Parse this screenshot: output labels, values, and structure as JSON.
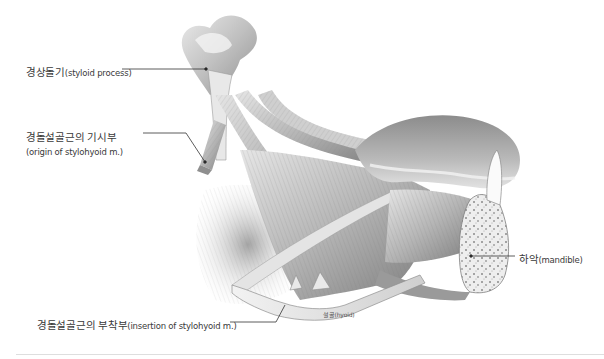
{
  "figure": {
    "labels": {
      "styloid_process": {
        "ko": "경상돌기",
        "en": "(styloid process)"
      },
      "origin": {
        "ko": "경돌설골근의 기시부",
        "en": "(origin of stylohyoid m.)"
      },
      "insertion": {
        "ko": "경돌설골근의 부착부",
        "en": "(insertion of stylohyoid m.)"
      },
      "mandible": {
        "ko": "하악",
        "en": "(mandible)"
      }
    },
    "inline_labels": {
      "hyoid": "설골(hyoid)",
      "muscle_1": "경돌설골근",
      "muscle_2": "구개설근",
      "muscle_3": "경돌설근",
      "muscle_4": "설골설근",
      "muscle_5": "이설근",
      "muscle_6": "악이복근",
      "muscle_7": "이설골근"
    },
    "colors": {
      "background": "#ffffff",
      "muscle_light": "#d9d9d9",
      "muscle_mid": "#a8a8a8",
      "muscle_dark": "#6e6e6e",
      "leader_line": "#333333",
      "divider": "#dedede"
    }
  }
}
